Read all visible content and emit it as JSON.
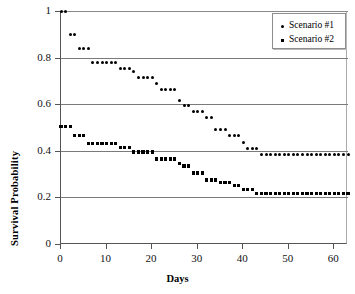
{
  "chart_data": {
    "type": "scatter",
    "title": "",
    "xlabel": "Days",
    "ylabel": "Survival Probability",
    "xlim": [
      0,
      63
    ],
    "ylim": [
      0,
      1
    ],
    "xticks": [
      0,
      10,
      20,
      30,
      40,
      50,
      60
    ],
    "xtick_labels": [
      "0",
      "10",
      "20",
      "30",
      "40",
      "50",
      "60"
    ],
    "yticks": [
      0,
      0.2,
      0.4,
      0.6,
      0.8,
      1
    ],
    "ytick_labels": [
      "0",
      "0.2",
      "0.4",
      "0.6",
      "0.8",
      "1"
    ],
    "grid": "horizontal",
    "legend_position": "top-right",
    "marker_color": "#000000",
    "gridline_color": "#7a7a7a",
    "axis_color": "#555555",
    "background": "#ffffff",
    "series": [
      {
        "name": "Scenario #1",
        "marker": "circle",
        "x": [
          0,
          1,
          2,
          3,
          4,
          5,
          6,
          7,
          8,
          9,
          10,
          11,
          12,
          13,
          14,
          15,
          16,
          17,
          18,
          19,
          20,
          21,
          22,
          23,
          24,
          25,
          26,
          27,
          28,
          29,
          30,
          31,
          32,
          33,
          34,
          35,
          36,
          37,
          38,
          39,
          40,
          41,
          42,
          43,
          44,
          45,
          46,
          47,
          48,
          49,
          50,
          51,
          52,
          53,
          54,
          55,
          56,
          57,
          58,
          59,
          60,
          61,
          62,
          63
        ],
        "values": [
          1.0,
          1.0,
          0.9,
          0.9,
          0.84,
          0.84,
          0.84,
          0.78,
          0.78,
          0.78,
          0.78,
          0.78,
          0.78,
          0.755,
          0.755,
          0.755,
          0.74,
          0.715,
          0.715,
          0.715,
          0.715,
          0.69,
          0.665,
          0.665,
          0.665,
          0.665,
          0.615,
          0.595,
          0.595,
          0.57,
          0.57,
          0.57,
          0.545,
          0.545,
          0.49,
          0.49,
          0.49,
          0.465,
          0.465,
          0.465,
          0.435,
          0.41,
          0.41,
          0.41,
          0.385,
          0.385,
          0.385,
          0.385,
          0.385,
          0.385,
          0.385,
          0.385,
          0.385,
          0.385,
          0.385,
          0.385,
          0.385,
          0.385,
          0.385,
          0.385,
          0.385,
          0.385,
          0.385,
          0.385
        ]
      },
      {
        "name": "Scenario #2",
        "marker": "square",
        "x": [
          0,
          1,
          2,
          3,
          4,
          5,
          6,
          7,
          8,
          9,
          10,
          11,
          12,
          13,
          14,
          15,
          16,
          17,
          18,
          19,
          20,
          21,
          22,
          23,
          24,
          25,
          26,
          27,
          28,
          29,
          30,
          31,
          32,
          33,
          34,
          35,
          36,
          37,
          38,
          39,
          40,
          41,
          42,
          43,
          44,
          45,
          46,
          47,
          48,
          49,
          50,
          51,
          52,
          53,
          54,
          55,
          56,
          57,
          58,
          59,
          60,
          61,
          62,
          63
        ],
        "values": [
          0.505,
          0.505,
          0.505,
          0.465,
          0.465,
          0.465,
          0.43,
          0.43,
          0.43,
          0.43,
          0.43,
          0.43,
          0.43,
          0.415,
          0.415,
          0.415,
          0.395,
          0.395,
          0.395,
          0.395,
          0.395,
          0.365,
          0.365,
          0.365,
          0.365,
          0.365,
          0.345,
          0.335,
          0.335,
          0.305,
          0.305,
          0.305,
          0.275,
          0.275,
          0.275,
          0.265,
          0.265,
          0.265,
          0.25,
          0.25,
          0.235,
          0.235,
          0.235,
          0.215,
          0.215,
          0.215,
          0.215,
          0.215,
          0.215,
          0.215,
          0.215,
          0.215,
          0.215,
          0.215,
          0.215,
          0.215,
          0.215,
          0.215,
          0.215,
          0.215,
          0.215,
          0.215,
          0.215,
          0.215
        ]
      }
    ]
  },
  "legend": {
    "items": [
      {
        "label": "Scenario #1",
        "marker": "circle"
      },
      {
        "label": "Scenario #2",
        "marker": "square"
      }
    ]
  },
  "axes": {
    "x_title": "Days",
    "y_title": "Survival Probability"
  }
}
